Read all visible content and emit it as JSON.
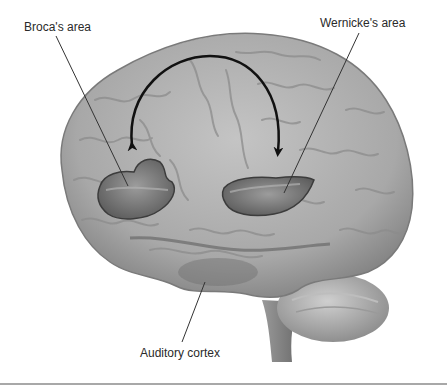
{
  "figure": {
    "labels": {
      "broca": "Broca's area",
      "wernicke": "Wernicke's area",
      "auditory": "Auditory cortex"
    },
    "arrow": {
      "from": "Wernicke's area",
      "to": "Broca's area",
      "style": "curved double-headed arc"
    },
    "colors": {
      "background": "#ffffff",
      "brain_fill": "#a9a9a9",
      "brain_shadow": "#6e6e6e",
      "highlight_region": "#7a7a7a",
      "label_text": "#2a2a2a",
      "leader_line": "#333333",
      "arrow": "#111111",
      "divider": "#a8a8a8"
    }
  }
}
